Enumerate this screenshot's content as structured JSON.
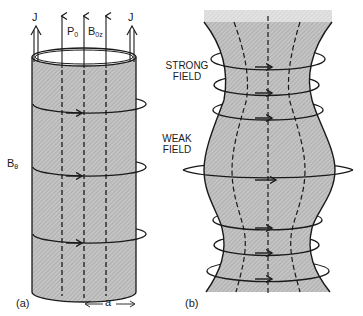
{
  "figure_a": {
    "panel_label": "(a)",
    "current_label_left": "J",
    "current_label_right": "J",
    "pressure_label": "P",
    "pressure_sub": "0",
    "axial_field_label": "B",
    "axial_field_sub": "0z",
    "azimuthal_field_label": "B",
    "azimuthal_field_sub": "θ",
    "radius_label": "a"
  },
  "figure_b": {
    "panel_label": "(b)",
    "strong_field_label_line1": "STRONG",
    "strong_field_label_line2": "FIELD",
    "weak_field_label_line1": "WEAK",
    "weak_field_label_line2": "FIELD"
  },
  "colors": {
    "ink": "#1a1a1a",
    "plasma_fill": "#b8b8b8",
    "background": "#ffffff"
  }
}
